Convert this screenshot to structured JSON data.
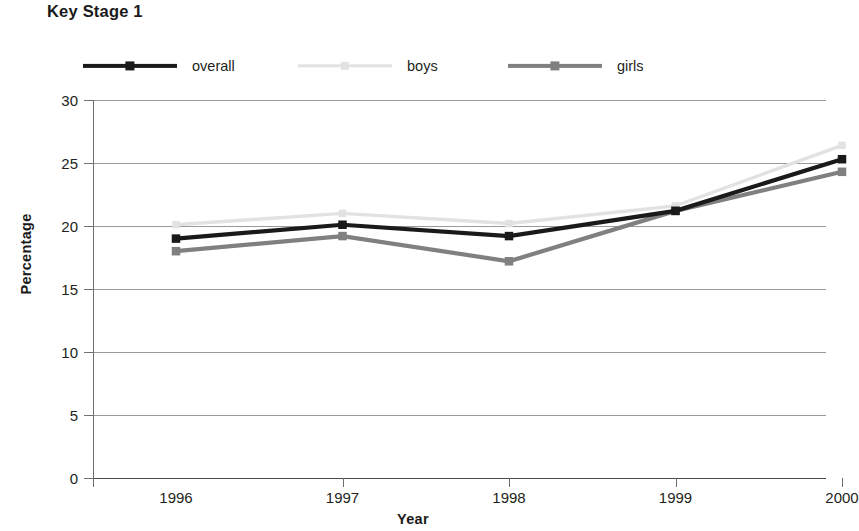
{
  "chart_title": "Key Stage 1",
  "axis": {
    "y_title": "Percentage",
    "x_title": "Year",
    "y_ticks": [
      "0",
      "5",
      "10",
      "15",
      "20",
      "25",
      "30"
    ],
    "x_ticks": [
      "1996",
      "1997",
      "1998",
      "1999",
      "2000"
    ]
  },
  "legend": {
    "items": [
      {
        "label": "overall",
        "color": "#1a1a1a",
        "marker": "square",
        "width": 4.2
      },
      {
        "label": "boys",
        "color": "#e2e2e2",
        "marker": "square",
        "width": 3.4
      },
      {
        "label": "girls",
        "color": "#808080",
        "marker": "square",
        "width": 4.2
      }
    ]
  },
  "chart_data": {
    "type": "line",
    "title": "Key Stage 1",
    "xlabel": "Year",
    "ylabel": "Percentage",
    "categories": [
      "1996",
      "1997",
      "1998",
      "1999",
      "2000"
    ],
    "ylim": [
      0,
      30
    ],
    "yticks": [
      0,
      5,
      10,
      15,
      20,
      25,
      30
    ],
    "grid": true,
    "legend_position": "top",
    "series": [
      {
        "name": "overall",
        "color": "#1a1a1a",
        "values": [
          19.0,
          20.1,
          19.2,
          21.2,
          25.3
        ]
      },
      {
        "name": "boys",
        "color": "#e2e2e2",
        "values": [
          20.1,
          21.0,
          20.2,
          21.6,
          26.4
        ]
      },
      {
        "name": "girls",
        "color": "#808080",
        "values": [
          18.0,
          19.2,
          17.2,
          21.2,
          24.3
        ]
      }
    ]
  }
}
